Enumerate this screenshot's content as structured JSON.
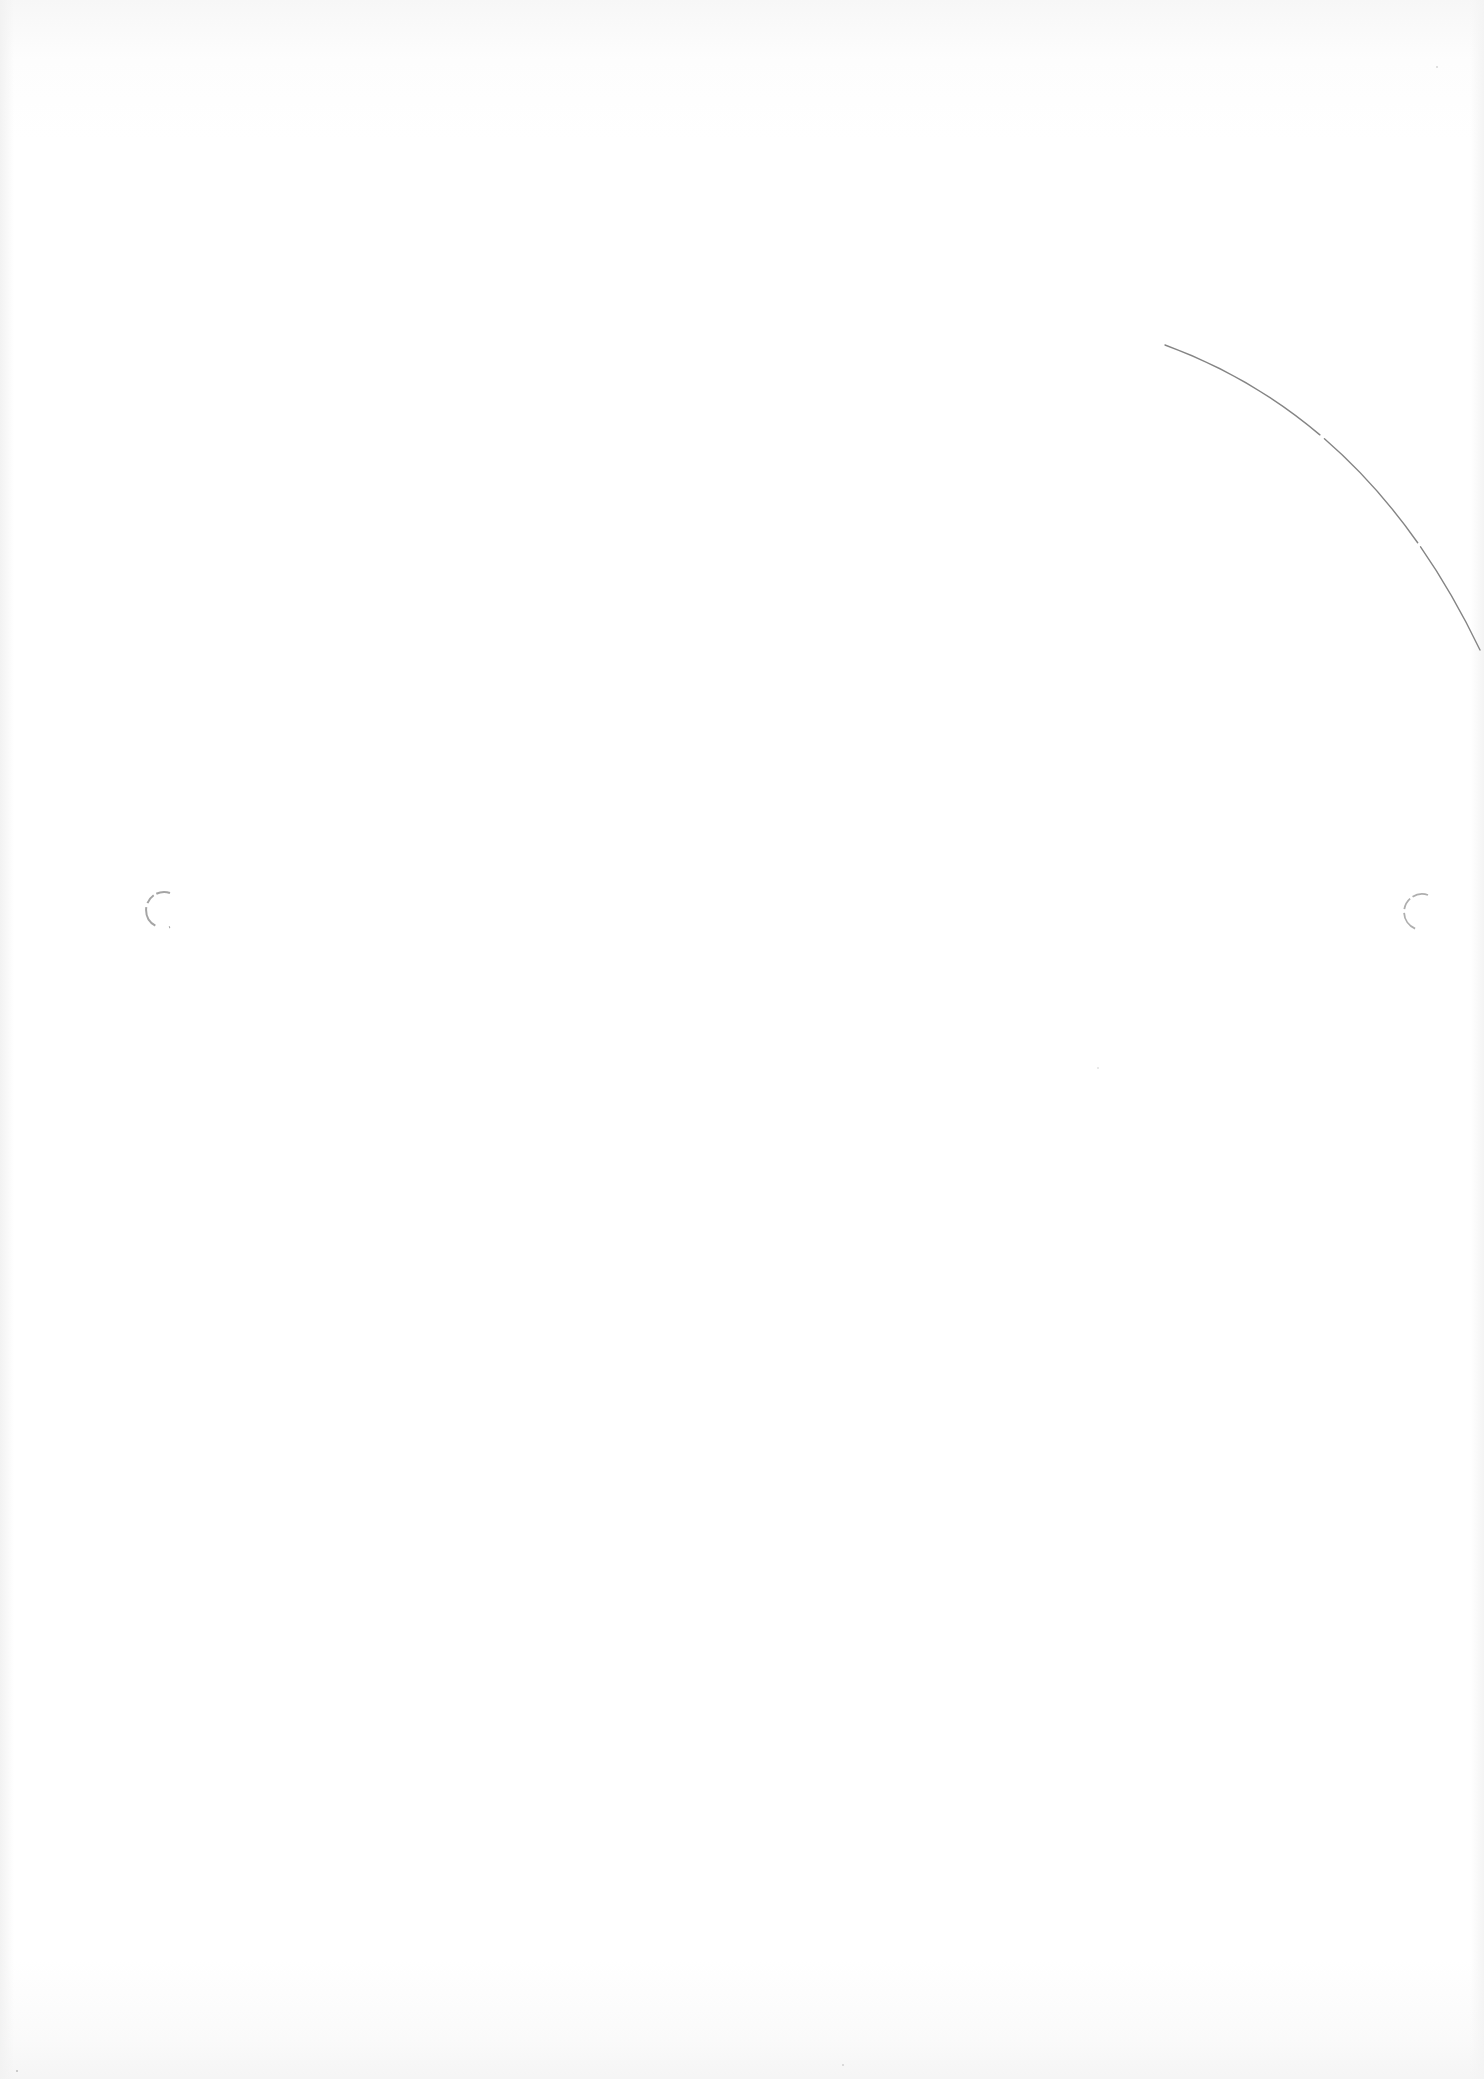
{
  "document": {
    "type": "blank scanned page",
    "text_content": "",
    "background_color": "#ffffff",
    "marks": {
      "arc": {
        "description": "faint curved pencil line in upper-right area",
        "color": "#6e6e6e",
        "path": "M 1165 345 Q 1370 420 1480 650"
      },
      "punch_holes": [
        {
          "name": "left-punch-hole",
          "cx": 153,
          "cy": 910,
          "r": 18,
          "color": "#9a9a9a"
        },
        {
          "name": "right-punch-hole",
          "cx": 1411,
          "cy": 912,
          "r": 18,
          "color": "#a5a5a5"
        }
      ],
      "specks": [
        {
          "x": 16,
          "y": 2070
        },
        {
          "x": 842,
          "y": 2064
        },
        {
          "x": 1436,
          "y": 66
        },
        {
          "x": 1097,
          "y": 1067
        }
      ]
    }
  }
}
